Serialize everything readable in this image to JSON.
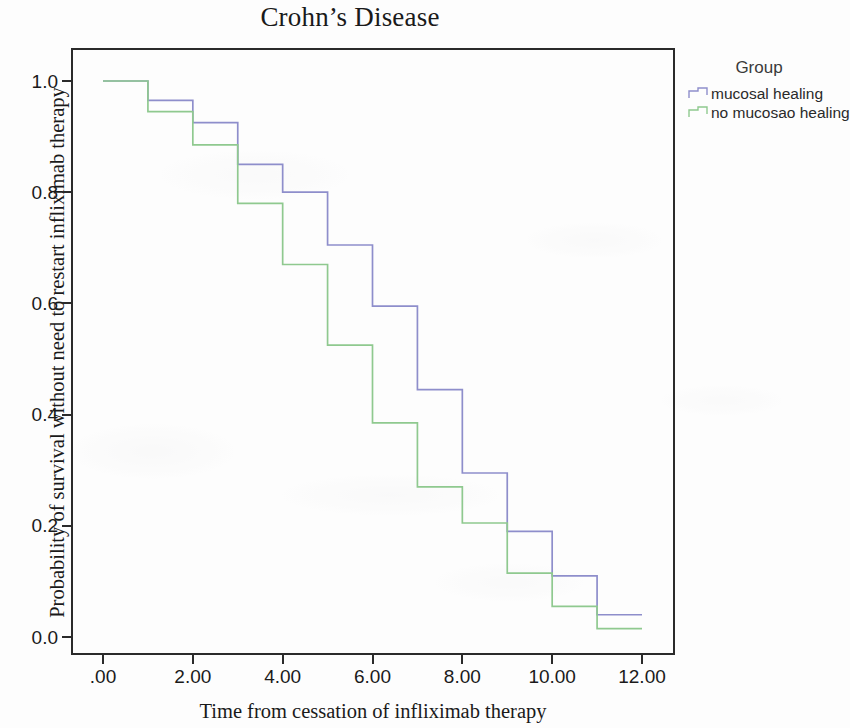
{
  "chart_data": {
    "type": "line",
    "title": "Crohn’s Disease",
    "subtitle": "",
    "xlabel": "Time from cessation of infliximab therapy",
    "ylabel": "Probability of survival without need to restart infliximab therapy",
    "xlim": [
      0,
      12
    ],
    "ylim": [
      0,
      1
    ],
    "xticks": [
      0,
      2,
      4,
      6,
      8,
      10,
      12
    ],
    "xticklabels": [
      ".00",
      "2.00",
      "4.00",
      "6.00",
      "8.00",
      "10.00",
      "12.00"
    ],
    "yticks": [
      0.0,
      0.2,
      0.4,
      0.6,
      0.8,
      1.0
    ],
    "yticklabels": [
      "0.0",
      "0.2",
      "0.4",
      "0.6",
      "0.8",
      "1.0"
    ],
    "grid": false,
    "legend_position": "right",
    "legend_title": "Group",
    "step_style": "post",
    "series": [
      {
        "name": "mucosal healing",
        "color": "#8e8ecb",
        "x": [
          0,
          1,
          2,
          3,
          4,
          5,
          6,
          7,
          8,
          9,
          10,
          11,
          12
        ],
        "values": [
          1.0,
          0.965,
          0.925,
          0.85,
          0.8,
          0.705,
          0.595,
          0.445,
          0.295,
          0.19,
          0.11,
          0.04,
          0.04
        ]
      },
      {
        "name": "no mucosao healing",
        "color": "#8fc98f",
        "x": [
          0,
          1,
          2,
          3,
          4,
          5,
          6,
          7,
          8,
          9,
          10,
          11,
          12
        ],
        "values": [
          1.0,
          0.945,
          0.885,
          0.78,
          0.67,
          0.525,
          0.385,
          0.27,
          0.205,
          0.115,
          0.055,
          0.015,
          0.015
        ]
      }
    ]
  },
  "legend": {
    "title": "Group",
    "entries": [
      {
        "label": "mucosal healing",
        "color": "#8e8ecb"
      },
      {
        "label": "no mucosao healing",
        "color": "#8fc98f"
      }
    ]
  }
}
